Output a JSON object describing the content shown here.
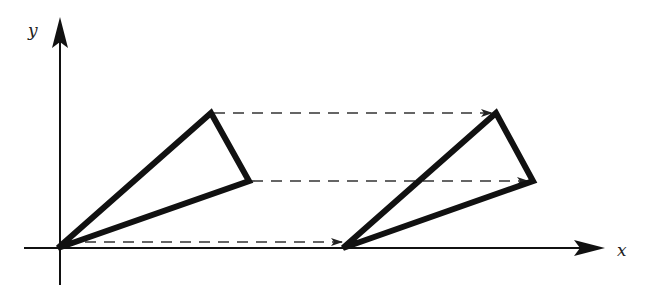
{
  "diagram": {
    "axes": {
      "x_label": "x",
      "y_label": "y",
      "origin_px": [
        58,
        248
      ]
    },
    "original_triangle": {
      "vertices_px": [
        [
          58,
          248
        ],
        [
          211,
          113
        ],
        [
          249,
          181
        ]
      ]
    },
    "translated_triangle": {
      "vertices_px": [
        [
          343,
          248
        ],
        [
          496,
          113
        ],
        [
          533,
          181
        ]
      ]
    },
    "translation_arrows": [
      {
        "from": [
          211,
          113
        ],
        "to": [
          496,
          113
        ],
        "style": "dashed"
      },
      {
        "from": [
          249,
          181
        ],
        "to": [
          533,
          181
        ],
        "style": "dashed"
      },
      {
        "from": [
          58,
          242
        ],
        "to": [
          343,
          242
        ],
        "style": "dashed"
      }
    ],
    "colors": {
      "line": "#111111",
      "background": "#ffffff"
    }
  }
}
